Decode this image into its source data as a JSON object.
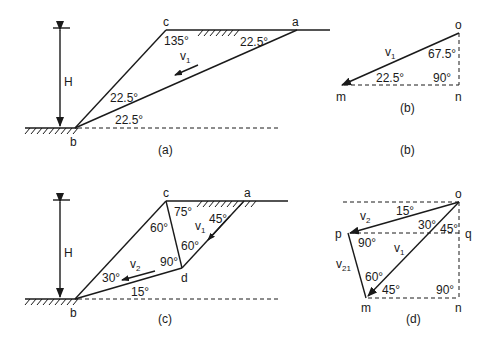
{
  "figures": {
    "a": {
      "caption": "(a)",
      "points": {
        "b": "b",
        "c": "c",
        "a": "a"
      },
      "height_label": "H",
      "velocity_label": "v",
      "velocity_sub": "1",
      "angles": {
        "at_c": "135°",
        "at_a": "22.5°",
        "upper_b": "22.5°",
        "lower_b": "22.5°"
      }
    },
    "b": {
      "caption_inner": "(b)",
      "caption_outer": "(b)",
      "points": {
        "o": "o",
        "m": "m",
        "n": "n"
      },
      "velocity_label": "v",
      "velocity_sub": "1",
      "angles": {
        "at_o": "67.5°",
        "at_m": "22.5°",
        "at_n": "90°"
      }
    },
    "c": {
      "caption": "(c)",
      "points": {
        "b": "b",
        "c": "c",
        "a": "a",
        "d": "d"
      },
      "height_label": "H",
      "v1_label": "v",
      "v1_sub": "1",
      "v2_label": "v",
      "v2_sub": "2",
      "angles": {
        "c_right": "75°",
        "a_left": "45°",
        "c_below": "60°",
        "d_upper": "60°",
        "d_left": "90°",
        "b_upper": "30°",
        "b_lower": "15°"
      }
    },
    "d": {
      "caption": "(d)",
      "points": {
        "o": "o",
        "p": "p",
        "q": "q",
        "m": "m",
        "n": "n"
      },
      "v2_label": "v",
      "v2_sub": "2",
      "v1_label": "v",
      "v1_sub": "1",
      "v21_label": "v",
      "v21_sub": "21",
      "angles": {
        "o_v2": "15°",
        "o_mid": "30°",
        "o_q": "45°",
        "p": "90°",
        "m_upper": "60°",
        "m_lower": "45°",
        "n": "90°"
      }
    }
  }
}
